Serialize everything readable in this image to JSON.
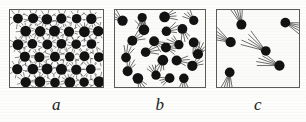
{
  "figure": {
    "background_color": "#fdfdfc",
    "ink_color": "#121212",
    "border_color": "#5b5b58",
    "panels": [
      {
        "id": "a",
        "caption": "a",
        "state": "solid",
        "description": "Closely packed particles in a regular staggered lattice, each vibrating about a fixed position",
        "particle_count": 35,
        "motion": "vibration",
        "trail_style": "short radiating vibration lines",
        "trail_length_px": 4,
        "trail_count_per_particle": 8,
        "particle_radius_px": 5.2,
        "order": "ordered-lattice",
        "lattice": {
          "rows": 6,
          "columns": 6,
          "stagger": true,
          "row_spacing_px": 13,
          "column_spacing_px": 15
        }
      },
      {
        "id": "b",
        "caption": "b",
        "state": "liquid",
        "description": "Particles touching but disordered, each with a short motion trail showing limited movement",
        "particle_count": 23,
        "motion": "short-range translation",
        "trail_style": "short fan of motion lines",
        "trail_length_px": 7,
        "trail_count_per_particle": 4,
        "particle_radius_px": 5.0,
        "order": "disordered-dense"
      },
      {
        "id": "c",
        "caption": "c",
        "state": "gas",
        "description": "Few widely separated particles, each with a long fan of motion lines showing rapid free travel",
        "particle_count": 6,
        "motion": "free rapid translation",
        "trail_style": "long fan of motion lines",
        "trail_length_px": 18,
        "trail_count_per_particle": 5,
        "particle_radius_px": 5.0,
        "order": "disordered-sparse"
      }
    ]
  },
  "chart_data": {
    "type": "diagram",
    "xlabel": "",
    "ylabel": "",
    "categories": [
      "a",
      "b",
      "c"
    ],
    "series": [
      {
        "name": "particle_count",
        "values": [
          35,
          23,
          6
        ]
      },
      {
        "name": "trail_length_px",
        "values": [
          4,
          7,
          18
        ]
      }
    ],
    "annotations": [
      "a",
      "b",
      "c"
    ],
    "legend_position": "none",
    "grid": false
  }
}
